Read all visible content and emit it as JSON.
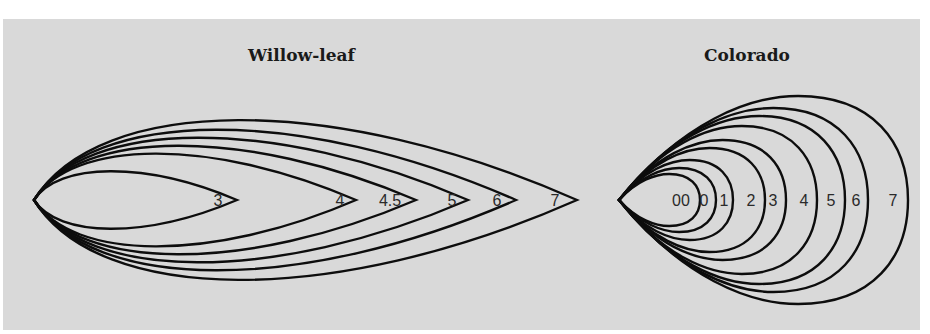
{
  "figure": {
    "background": "#d9d9d9",
    "stroke_color": "#0d0d0d",
    "groups": [
      {
        "id": "willow-leaf",
        "title": "Willow-leaf",
        "tip": [
          34,
          200
        ],
        "sizes": [
          {
            "label": "3",
            "tip_x": 237,
            "half_height": 36,
            "label_x": 218
          },
          {
            "label": "4",
            "tip_x": 356,
            "half_height": 58,
            "label_x": 340
          },
          {
            "label": "4.5",
            "tip_x": 416,
            "half_height": 68,
            "label_x": 390
          },
          {
            "label": "5",
            "tip_x": 468,
            "half_height": 78,
            "label_x": 452
          },
          {
            "label": "6",
            "tip_x": 516,
            "half_height": 88,
            "label_x": 497
          },
          {
            "label": "7",
            "tip_x": 577,
            "half_height": 100,
            "label_x": 555
          }
        ]
      },
      {
        "id": "colorado",
        "title": "Colorado",
        "tip": [
          619,
          200
        ],
        "sizes": [
          {
            "label": "00",
            "right_x": 700,
            "half_height": 26,
            "label_x": 681
          },
          {
            "label": "0",
            "right_x": 716,
            "half_height": 32,
            "label_x": 704
          },
          {
            "label": "1",
            "right_x": 733,
            "half_height": 40,
            "label_x": 724
          },
          {
            "label": "2",
            "right_x": 765,
            "half_height": 52,
            "label_x": 751
          },
          {
            "label": "3",
            "right_x": 786,
            "half_height": 60,
            "label_x": 773
          },
          {
            "label": "4",
            "right_x": 817,
            "half_height": 74,
            "label_x": 804
          },
          {
            "label": "5",
            "right_x": 845,
            "half_height": 84,
            "label_x": 831
          },
          {
            "label": "6",
            "right_x": 868,
            "half_height": 92,
            "label_x": 856
          },
          {
            "label": "7",
            "right_x": 908,
            "half_height": 104,
            "label_x": 893
          }
        ]
      }
    ]
  }
}
